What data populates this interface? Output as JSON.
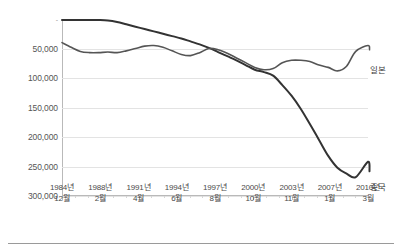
{
  "chart_data": {
    "type": "line",
    "title": "",
    "subtitle": "",
    "xlabel": "",
    "ylabel": "",
    "y_inverted": true,
    "ylim": [
      0,
      300000
    ],
    "grid": true,
    "legend_position": "right-inline",
    "y_ticks": [
      "-",
      "50,000",
      "100,000",
      "150,000",
      "200,000",
      "250,000",
      "300,000"
    ],
    "y_tick_values": [
      0,
      50000,
      100000,
      150000,
      200000,
      250000,
      300000
    ],
    "categories": [
      "1984년 12월",
      "1988년 2월",
      "1991년 4월",
      "1994년 6월",
      "1997년 8월",
      "2000년 10월",
      "2003년 11월",
      "2007년 1월",
      "2010년 3월"
    ],
    "x_tick_labels": [
      {
        "year": "1984년",
        "month": "12월"
      },
      {
        "year": "1988년",
        "month": "2월"
      },
      {
        "year": "1991년",
        "month": "4월"
      },
      {
        "year": "1994년",
        "month": "6월"
      },
      {
        "year": "1997년",
        "month": "8월"
      },
      {
        "year": "2000년",
        "month": "10월"
      },
      {
        "year": "2003년",
        "month": "11월"
      },
      {
        "year": "2007년",
        "month": "1월"
      },
      {
        "year": "2010년",
        "month": "3월"
      }
    ],
    "series": [
      {
        "name": "중국",
        "color": "#333333",
        "width": 2.0,
        "x": [
          0,
          3,
          6,
          9,
          12,
          15,
          18,
          21,
          24,
          27,
          30,
          33,
          36,
          39,
          42,
          45,
          48,
          51,
          54,
          57,
          60,
          63,
          66,
          69,
          72,
          75,
          78,
          81,
          84,
          87,
          90,
          93,
          96,
          100
        ],
        "values": [
          1500,
          1600,
          1600,
          1700,
          1800,
          2500,
          5000,
          9000,
          13000,
          17000,
          21000,
          25000,
          29000,
          33000,
          38000,
          43000,
          49000,
          56000,
          63000,
          70000,
          78000,
          86000,
          90000,
          96000,
          112000,
          130000,
          152000,
          178000,
          205000,
          232000,
          252000,
          262000,
          268000,
          242000
        ],
        "end_value": 258000
      },
      {
        "name": "일본",
        "color": "#555555",
        "width": 1.6,
        "x": [
          0,
          3,
          6,
          9,
          12,
          15,
          18,
          21,
          24,
          27,
          30,
          33,
          36,
          39,
          42,
          45,
          48,
          51,
          54,
          57,
          60,
          63,
          66,
          69,
          72,
          75,
          78,
          81,
          84,
          87,
          90,
          93,
          96,
          100
        ],
        "values": [
          40000,
          48000,
          55000,
          57000,
          57000,
          56000,
          57000,
          54000,
          50000,
          46000,
          45000,
          48000,
          54000,
          60000,
          62000,
          57000,
          50000,
          52000,
          58000,
          66000,
          74000,
          82000,
          86000,
          84000,
          74000,
          70000,
          70000,
          72000,
          78000,
          82000,
          88000,
          80000,
          55000,
          45000
        ],
        "end_value": 52000
      }
    ],
    "annotations": [
      {
        "name": "japan-series-label",
        "text": "일본",
        "x_px": 370,
        "y_px": 63
      },
      {
        "name": "china-series-label",
        "text": "중국",
        "x_px": 370,
        "y_px": 180
      }
    ]
  }
}
